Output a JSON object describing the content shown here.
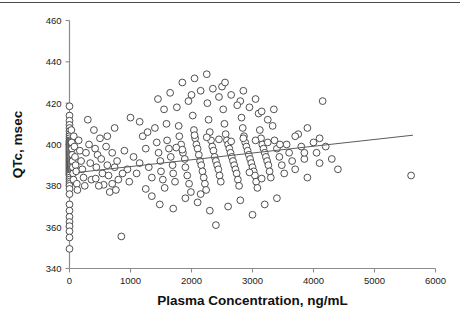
{
  "figure": {
    "name": "qtc-vs-plasma-concentration-scatter"
  },
  "chart_data": {
    "type": "scatter",
    "title": "",
    "xlabel": "Plasma Concentration, ng/mL",
    "ylabel": "QTc, msec",
    "xlim": [
      0,
      6000
    ],
    "ylim": [
      340,
      460
    ],
    "xticks": [
      0,
      1000,
      2000,
      3000,
      4000,
      5000,
      6000
    ],
    "yticks": [
      340,
      360,
      380,
      400,
      420,
      440,
      460
    ],
    "xtick_labels": [
      "0",
      "1000",
      "2000",
      "3000",
      "4000",
      "5000",
      "6000"
    ],
    "ytick_labels": [
      "340",
      "360",
      "380",
      "400",
      "420",
      "440",
      "460"
    ],
    "grid": false,
    "legend": false,
    "marker": {
      "shape": "open-circle",
      "radius_px": 3.4,
      "fill": "#ffffff",
      "stroke": "#3c3c3c"
    },
    "regression_line": {
      "label": "linear fit",
      "color": "#5b5b5b",
      "x_start": 140,
      "y_start": 386.5,
      "x_end": 5630,
      "y_end": 404.5
    },
    "series": [
      {
        "name": "QTc vs plasma concentration",
        "points": [
          [
            0,
            418.5
          ],
          [
            0,
            414.0
          ],
          [
            0,
            411.5
          ],
          [
            0,
            409.5
          ],
          [
            0,
            408.0
          ],
          [
            0,
            406.5
          ],
          [
            0,
            405.0
          ],
          [
            0,
            404.0
          ],
          [
            0,
            403.0
          ],
          [
            0,
            402.0
          ],
          [
            0,
            401.5
          ],
          [
            0,
            401.0
          ],
          [
            0,
            400.5
          ],
          [
            0,
            400.0
          ],
          [
            0,
            399.5
          ],
          [
            0,
            399.0
          ],
          [
            0,
            398.5
          ],
          [
            0,
            398.0
          ],
          [
            0,
            397.5
          ],
          [
            0,
            397.0
          ],
          [
            0,
            396.5
          ],
          [
            0,
            396.0
          ],
          [
            0,
            395.5
          ],
          [
            0,
            395.0
          ],
          [
            0,
            394.5
          ],
          [
            0,
            394.0
          ],
          [
            0,
            393.5
          ],
          [
            0,
            393.0
          ],
          [
            0,
            392.5
          ],
          [
            0,
            392.0
          ],
          [
            0,
            391.5
          ],
          [
            0,
            391.0
          ],
          [
            0,
            390.5
          ],
          [
            0,
            390.0
          ],
          [
            0,
            389.5
          ],
          [
            0,
            389.0
          ],
          [
            0,
            388.5
          ],
          [
            0,
            388.0
          ],
          [
            0,
            387.5
          ],
          [
            0,
            387.0
          ],
          [
            0,
            386.5
          ],
          [
            0,
            386.0
          ],
          [
            0,
            385.5
          ],
          [
            0,
            385.0
          ],
          [
            0,
            384.0
          ],
          [
            0,
            383.0
          ],
          [
            0,
            382.0
          ],
          [
            0,
            381.0
          ],
          [
            0,
            380.0
          ],
          [
            0,
            378.5
          ],
          [
            0,
            376.0
          ],
          [
            0,
            371.0
          ],
          [
            0,
            368.0
          ],
          [
            0,
            365.0
          ],
          [
            0,
            362.5
          ],
          [
            0,
            360.5
          ],
          [
            0,
            358.0
          ],
          [
            0,
            355.0
          ],
          [
            0,
            349.5
          ],
          [
            30,
            407.0
          ],
          [
            35,
            401.0
          ],
          [
            40,
            398.0
          ],
          [
            45,
            395.0
          ],
          [
            50,
            392.0
          ],
          [
            55,
            389.0
          ],
          [
            60,
            386.0
          ],
          [
            65,
            383.0
          ],
          [
            70,
            404.0
          ],
          [
            80,
            399.0
          ],
          [
            90,
            394.0
          ],
          [
            100,
            390.0
          ],
          [
            110,
            387.0
          ],
          [
            120,
            381.0
          ],
          [
            130,
            378.0
          ],
          [
            150,
            402.0
          ],
          [
            170,
            397.0
          ],
          [
            190,
            392.0
          ],
          [
            210,
            388.0
          ],
          [
            230,
            384.0
          ],
          [
            250,
            380.0
          ],
          [
            270,
            396.0
          ],
          [
            300,
            412.0
          ],
          [
            320,
            400.0
          ],
          [
            340,
            391.0
          ],
          [
            360,
            383.0
          ],
          [
            400,
            407.0
          ],
          [
            420,
            398.0
          ],
          [
            440,
            389.0
          ],
          [
            460,
            395.0
          ],
          [
            500,
            403.0
          ],
          [
            520,
            393.0
          ],
          [
            540,
            386.0
          ],
          [
            560,
            380.5
          ],
          [
            600,
            399.0
          ],
          [
            620,
            390.0
          ],
          [
            640,
            385.0
          ],
          [
            660,
            377.0
          ],
          [
            700,
            396.0
          ],
          [
            740,
            389.0
          ],
          [
            780,
            392.0
          ],
          [
            800,
            383.0
          ],
          [
            850,
            355.5
          ],
          [
            900,
            397.0
          ],
          [
            950,
            388.0
          ],
          [
            1000,
            413.0
          ],
          [
            1050,
            394.0
          ],
          [
            1100,
            386.0
          ],
          [
            1150,
            391.0
          ],
          [
            1200,
            404.0
          ],
          [
            1250,
            398.0
          ],
          [
            1300,
            389.0
          ],
          [
            1350,
            384.0
          ],
          [
            1400,
            408.0
          ],
          [
            1430,
            401.0
          ],
          [
            1460,
            396.0
          ],
          [
            1490,
            392.0
          ],
          [
            1500,
            387.0
          ],
          [
            1530,
            383.0
          ],
          [
            1560,
            379.0
          ],
          [
            1590,
            410.0
          ],
          [
            1600,
            402.0
          ],
          [
            1630,
            398.0
          ],
          [
            1660,
            394.0
          ],
          [
            1690,
            390.0
          ],
          [
            1700,
            386.0
          ],
          [
            1730,
            382.0
          ],
          [
            1760,
            418.0
          ],
          [
            1790,
            409.0
          ],
          [
            1800,
            404.0
          ],
          [
            1830,
            400.0
          ],
          [
            1860,
            396.0
          ],
          [
            1890,
            393.0
          ],
          [
            1900,
            389.0
          ],
          [
            1930,
            385.0
          ],
          [
            1960,
            381.0
          ],
          [
            1990,
            377.0
          ],
          [
            2000,
            424.0
          ],
          [
            2020,
            414.0
          ],
          [
            2040,
            407.0
          ],
          [
            2060,
            403.0
          ],
          [
            2080,
            400.0
          ],
          [
            2100,
            398.0
          ],
          [
            2120,
            395.0
          ],
          [
            2140,
            392.0
          ],
          [
            2160,
            390.0
          ],
          [
            2180,
            387.0
          ],
          [
            2200,
            384.0
          ],
          [
            2220,
            381.0
          ],
          [
            2240,
            378.0
          ],
          [
            2260,
            420.0
          ],
          [
            2280,
            412.0
          ],
          [
            2300,
            406.0
          ],
          [
            2320,
            402.0
          ],
          [
            2340,
            399.0
          ],
          [
            2360,
            397.0
          ],
          [
            2380,
            394.0
          ],
          [
            2400,
            392.0
          ],
          [
            2420,
            390.0
          ],
          [
            2440,
            388.0
          ],
          [
            2460,
            385.0
          ],
          [
            2480,
            382.0
          ],
          [
            2500,
            428.0
          ],
          [
            2520,
            417.0
          ],
          [
            2540,
            410.0
          ],
          [
            2560,
            405.0
          ],
          [
            2580,
            402.0
          ],
          [
            2600,
            400.0
          ],
          [
            2620,
            398.0
          ],
          [
            2640,
            396.0
          ],
          [
            2660,
            394.0
          ],
          [
            2680,
            392.0
          ],
          [
            2700,
            390.0
          ],
          [
            2720,
            388.0
          ],
          [
            2740,
            386.0
          ],
          [
            2760,
            383.0
          ],
          [
            2780,
            380.0
          ],
          [
            2800,
            421.0
          ],
          [
            2820,
            413.0
          ],
          [
            2840,
            408.0
          ],
          [
            2860,
            404.0
          ],
          [
            2880,
            401.0
          ],
          [
            2900,
            399.0
          ],
          [
            2920,
            397.0
          ],
          [
            2940,
            395.0
          ],
          [
            2960,
            393.0
          ],
          [
            2980,
            391.0
          ],
          [
            3000,
            389.0
          ],
          [
            3020,
            387.0
          ],
          [
            3040,
            385.0
          ],
          [
            3060,
            382.0
          ],
          [
            3080,
            379.0
          ],
          [
            3100,
            415.0
          ],
          [
            3120,
            407.0
          ],
          [
            3140,
            403.0
          ],
          [
            3160,
            400.0
          ],
          [
            3180,
            398.0
          ],
          [
            3200,
            396.0
          ],
          [
            3220,
            394.0
          ],
          [
            3240,
            392.0
          ],
          [
            3260,
            390.0
          ],
          [
            3280,
            387.0
          ],
          [
            3300,
            384.0
          ],
          [
            3330,
            409.0
          ],
          [
            3360,
            402.0
          ],
          [
            3400,
            398.0
          ],
          [
            3440,
            394.0
          ],
          [
            3480,
            390.0
          ],
          [
            3520,
            386.0
          ],
          [
            3560,
            400.0
          ],
          [
            3600,
            396.0
          ],
          [
            3650,
            392.0
          ],
          [
            3700,
            388.0
          ],
          [
            3750,
            405.0
          ],
          [
            3800,
            399.0
          ],
          [
            3850,
            393.0
          ],
          [
            3900,
            384.0
          ],
          [
            4000,
            401.0
          ],
          [
            4050,
            396.0
          ],
          [
            4100,
            391.0
          ],
          [
            4150,
            421.0
          ],
          [
            4200,
            399.0
          ],
          [
            4300,
            393.0
          ],
          [
            4400,
            388.0
          ],
          [
            1450,
            422.0
          ],
          [
            1550,
            417.0
          ],
          [
            1650,
            425.0
          ],
          [
            1850,
            430.0
          ],
          [
            1950,
            421.0
          ],
          [
            2050,
            432.0
          ],
          [
            2150,
            426.0
          ],
          [
            2250,
            434.0
          ],
          [
            2350,
            427.0
          ],
          [
            2450,
            423.0
          ],
          [
            2550,
            430.0
          ],
          [
            2650,
            424.0
          ],
          [
            2750,
            419.0
          ],
          [
            2850,
            426.0
          ],
          [
            2950,
            418.0
          ],
          [
            3050,
            422.0
          ],
          [
            3150,
            416.0
          ],
          [
            3250,
            412.0
          ],
          [
            3350,
            417.0
          ],
          [
            1480,
            371.0
          ],
          [
            1700,
            369.0
          ],
          [
            2100,
            372.0
          ],
          [
            2300,
            368.0
          ],
          [
            2600,
            370.0
          ],
          [
            2800,
            373.0
          ],
          [
            3000,
            366.0
          ],
          [
            3200,
            371.0
          ],
          [
            3400,
            374.0
          ],
          [
            2400,
            361.0
          ],
          [
            2150,
            376.0
          ],
          [
            1900,
            374.0
          ],
          [
            5600,
            385.0
          ],
          [
            430,
            383.5
          ],
          [
            480,
            380.0
          ],
          [
            700,
            381.0
          ],
          [
            760,
            378.0
          ],
          [
            1250,
            378.5
          ],
          [
            1350,
            375.0
          ],
          [
            870,
            386.0
          ],
          [
            980,
            382.0
          ],
          [
            620,
            404.0
          ],
          [
            740,
            408.0
          ],
          [
            1150,
            411.0
          ],
          [
            1280,
            406.0
          ],
          [
            3700,
            404.0
          ],
          [
            3900,
            408.0
          ],
          [
            4100,
            403.0
          ],
          [
            3850,
            396.0
          ],
          [
            2050,
            404.5
          ],
          [
            2250,
            403.5
          ],
          [
            2450,
            402.5
          ],
          [
            2650,
            401.5
          ],
          [
            2850,
            403.0
          ],
          [
            3050,
            402.0
          ],
          [
            3250,
            401.0
          ],
          [
            3450,
            400.0
          ],
          [
            1750,
            398.5
          ],
          [
            1850,
            397.5
          ],
          [
            2950,
            386.5
          ],
          [
            3150,
            383.5
          ]
        ]
      }
    ]
  },
  "axes": {
    "x_axis_name": "x-axis",
    "y_axis_name": "y-axis"
  }
}
